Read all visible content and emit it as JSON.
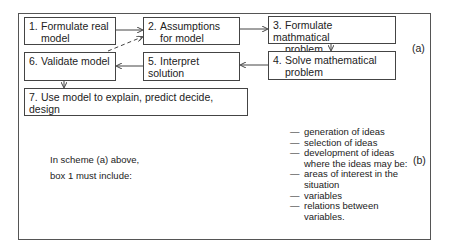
{
  "scheme_a": {
    "label": "(a)",
    "boxes": [
      {
        "num": "1.",
        "line1": "Formulate real",
        "line2": "model"
      },
      {
        "num": "2.",
        "line1": "Assumptions",
        "line2": "for model"
      },
      {
        "num": "3.",
        "line1": "Formulate mathmatical",
        "line2": "problem"
      },
      {
        "num": "4.",
        "line1": "Solve mathematical",
        "line2": "problem"
      },
      {
        "num": "5.",
        "line1": "Interpret solution",
        "line2": ""
      },
      {
        "num": "6.",
        "line1": "Validate model",
        "line2": ""
      },
      {
        "num": "7.",
        "line1": "Use model to explain, predict decide, design",
        "line2": ""
      }
    ]
  },
  "scheme_b": {
    "label": "(b)",
    "intro_line1": "In scheme (a) above,",
    "intro_line2": "box 1 must include:",
    "dash": "—",
    "items": [
      {
        "text": "generation of ideas",
        "dash": true
      },
      {
        "text": "selection of ideas",
        "dash": true
      },
      {
        "text": "development of ideas",
        "dash": true
      },
      {
        "text": "where the ideas may be:",
        "dash": false
      },
      {
        "text": "areas of interest in the",
        "dash": true
      },
      {
        "text": "situation",
        "dash": false
      },
      {
        "text": "variables",
        "dash": true
      },
      {
        "text": "relations between",
        "dash": true
      },
      {
        "text": "variables.",
        "dash": false
      }
    ]
  }
}
